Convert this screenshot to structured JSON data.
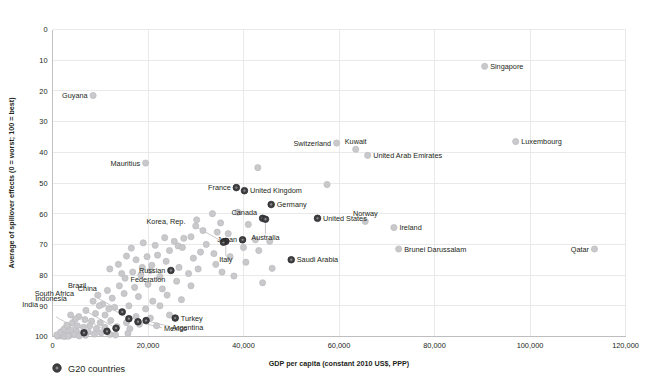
{
  "chart_data": {
    "type": "scatter",
    "title": "",
    "xlabel": "GDP per capita (constant 2010 US$, PPP)",
    "ylabel": "Average of spillover effects (0 = worst; 100 = best)",
    "xlim": [
      0,
      120000
    ],
    "ylim": [
      0,
      100
    ],
    "y_inverted": true,
    "xticks": [
      0,
      20000,
      40000,
      60000,
      80000,
      100000,
      120000
    ],
    "xticklabels": [
      "0",
      "20,000",
      "40,000",
      "60,000",
      "80,000",
      "100,000",
      "120,000"
    ],
    "yticks": [
      0,
      10,
      20,
      30,
      40,
      50,
      60,
      70,
      80,
      90,
      100
    ],
    "yticklabels": [
      "0",
      "10",
      "20",
      "30",
      "40",
      "50",
      "60",
      "70",
      "80",
      "90",
      "100"
    ],
    "grid": true,
    "legend_position": "bottom-left",
    "series": [
      {
        "name": "G20 countries",
        "color": "#3f3f42",
        "marker": "circle",
        "points": [
          {
            "label": "France",
            "x": 38500,
            "y": 51.5,
            "label_side": "left"
          },
          {
            "label": "United Kingdom",
            "x": 40200,
            "y": 52.5,
            "label_side": "right"
          },
          {
            "label": "Germany",
            "x": 45800,
            "y": 57.0,
            "label_side": "right"
          },
          {
            "label": "Canada",
            "x": 44000,
            "y": 61.5,
            "label_side": "left-above"
          },
          {
            "label": "United States",
            "x": 55500,
            "y": 61.5,
            "label_side": "right"
          },
          {
            "label": "Japan",
            "x": 39800,
            "y": 68.5,
            "label_side": "left"
          },
          {
            "label": "Australia",
            "x": 44600,
            "y": 61.8,
            "label_side": "below-leader"
          },
          {
            "label": "Italy",
            "x": 36300,
            "y": 69.0,
            "label_side": "below-leader"
          },
          {
            "label": "Korea, Rep.",
            "x": 35800,
            "y": 69.3,
            "label_side": "left-leader"
          },
          {
            "label": "Saudi Arabia",
            "x": 50000,
            "y": 75.0,
            "label_side": "right"
          },
          {
            "label": "Russian Federation",
            "x": 24800,
            "y": 78.5,
            "label_side": "left"
          },
          {
            "label": "Turkey",
            "x": 25700,
            "y": 94.0,
            "label_side": "right"
          },
          {
            "label": "Brazil",
            "x": 14600,
            "y": 92.0,
            "label_side": "left-leader"
          },
          {
            "label": "China",
            "x": 16000,
            "y": 94.2,
            "label_side": "left-leader"
          },
          {
            "label": "Argentina",
            "x": 19600,
            "y": 94.8,
            "label_side": "right-leader"
          },
          {
            "label": "Mexico",
            "x": 17900,
            "y": 95.2,
            "label_side": "right-leader"
          },
          {
            "label": "South Africa",
            "x": 13300,
            "y": 97.3,
            "label_side": "left-leader"
          },
          {
            "label": "Indonesia",
            "x": 11400,
            "y": 98.3,
            "label_side": "left-leader"
          },
          {
            "label": "India",
            "x": 6600,
            "y": 98.8,
            "label_side": "left-leader"
          }
        ]
      },
      {
        "name": "Other countries",
        "color": "#c9c9cc",
        "marker": "circle",
        "points": [
          {
            "label": "Singapore",
            "x": 90500,
            "y": 12.0,
            "label_side": "right"
          },
          {
            "label": "Guyana",
            "x": 8500,
            "y": 21.5,
            "label_side": "left"
          },
          {
            "label": "Luxembourg",
            "x": 97000,
            "y": 36.5,
            "label_side": "right"
          },
          {
            "label": "Switzerland",
            "x": 59500,
            "y": 37.0,
            "label_side": "left"
          },
          {
            "label": "Kuwait",
            "x": 63500,
            "y": 39.0,
            "label_side": "above"
          },
          {
            "label": "United Arab Emirates",
            "x": 66000,
            "y": 41.0,
            "label_side": "right"
          },
          {
            "label": "Mauritius",
            "x": 19500,
            "y": 43.5,
            "label_side": "left"
          },
          {
            "label": "Norway",
            "x": 65500,
            "y": 62.5,
            "label_side": "above"
          },
          {
            "label": "Ireland",
            "x": 71500,
            "y": 64.5,
            "label_side": "right"
          },
          {
            "label": "Brunei Darussalam",
            "x": 72500,
            "y": 71.5,
            "label_side": "right"
          },
          {
            "label": "Qatar",
            "x": 113500,
            "y": 71.5,
            "label_side": "left"
          },
          {
            "label": "",
            "x": 43000,
            "y": 45.0
          },
          {
            "label": "",
            "x": 57500,
            "y": 50.5
          },
          {
            "label": "",
            "x": 38800,
            "y": 59.5
          },
          {
            "label": "",
            "x": 33500,
            "y": 60.0
          },
          {
            "label": "",
            "x": 30000,
            "y": 64.0
          },
          {
            "label": "",
            "x": 31500,
            "y": 65.5
          },
          {
            "label": "",
            "x": 34500,
            "y": 66.0
          },
          {
            "label": "",
            "x": 36800,
            "y": 66.5
          },
          {
            "label": "",
            "x": 29000,
            "y": 67.5
          },
          {
            "label": "",
            "x": 27500,
            "y": 68.0
          },
          {
            "label": "",
            "x": 25500,
            "y": 69.0
          },
          {
            "label": "",
            "x": 23500,
            "y": 67.8
          },
          {
            "label": "",
            "x": 26300,
            "y": 70.5
          },
          {
            "label": "",
            "x": 27200,
            "y": 71.0
          },
          {
            "label": "",
            "x": 32200,
            "y": 70.0
          },
          {
            "label": "",
            "x": 42500,
            "y": 68.5
          },
          {
            "label": "",
            "x": 45500,
            "y": 69.0
          },
          {
            "label": "",
            "x": 21500,
            "y": 70.3
          },
          {
            "label": "",
            "x": 19000,
            "y": 69.5
          },
          {
            "label": "",
            "x": 16500,
            "y": 71.2
          },
          {
            "label": "",
            "x": 31000,
            "y": 72.5
          },
          {
            "label": "",
            "x": 33800,
            "y": 73.0
          },
          {
            "label": "",
            "x": 29500,
            "y": 74.5
          },
          {
            "label": "",
            "x": 24500,
            "y": 72.0
          },
          {
            "label": "",
            "x": 22000,
            "y": 73.5
          },
          {
            "label": "",
            "x": 19800,
            "y": 74.0
          },
          {
            "label": "",
            "x": 17500,
            "y": 75.0
          },
          {
            "label": "",
            "x": 15500,
            "y": 73.8
          },
          {
            "label": "",
            "x": 13800,
            "y": 76.5
          },
          {
            "label": "",
            "x": 12000,
            "y": 78.0
          },
          {
            "label": "",
            "x": 14500,
            "y": 79.5
          },
          {
            "label": "",
            "x": 16800,
            "y": 79.0
          },
          {
            "label": "",
            "x": 15200,
            "y": 81.0
          },
          {
            "label": "",
            "x": 18500,
            "y": 80.0
          },
          {
            "label": "",
            "x": 20500,
            "y": 78.5
          },
          {
            "label": "",
            "x": 22500,
            "y": 80.5
          },
          {
            "label": "",
            "x": 26500,
            "y": 77.5
          },
          {
            "label": "",
            "x": 28500,
            "y": 79.5
          },
          {
            "label": "",
            "x": 30500,
            "y": 78.0
          },
          {
            "label": "",
            "x": 35500,
            "y": 79.0
          },
          {
            "label": "",
            "x": 38000,
            "y": 80.3
          },
          {
            "label": "",
            "x": 44000,
            "y": 82.5
          },
          {
            "label": "",
            "x": 29000,
            "y": 83.5
          },
          {
            "label": "",
            "x": 26000,
            "y": 82.0
          },
          {
            "label": "",
            "x": 23000,
            "y": 84.5
          },
          {
            "label": "",
            "x": 20000,
            "y": 83.0
          },
          {
            "label": "",
            "x": 17200,
            "y": 84.0
          },
          {
            "label": "",
            "x": 14000,
            "y": 83.5
          },
          {
            "label": "",
            "x": 11500,
            "y": 85.0
          },
          {
            "label": "",
            "x": 9500,
            "y": 86.5
          },
          {
            "label": "",
            "x": 12500,
            "y": 87.5
          },
          {
            "label": "",
            "x": 15000,
            "y": 86.0
          },
          {
            "label": "",
            "x": 18000,
            "y": 87.0
          },
          {
            "label": "",
            "x": 21000,
            "y": 88.5
          },
          {
            "label": "",
            "x": 24000,
            "y": 86.5
          },
          {
            "label": "",
            "x": 27000,
            "y": 88.0
          },
          {
            "label": "",
            "x": 8500,
            "y": 88.5
          },
          {
            "label": "",
            "x": 10500,
            "y": 89.5
          },
          {
            "label": "",
            "x": 13000,
            "y": 90.5
          },
          {
            "label": "",
            "x": 16000,
            "y": 90.0
          },
          {
            "label": "",
            "x": 19500,
            "y": 91.0
          },
          {
            "label": "",
            "x": 22500,
            "y": 90.0
          },
          {
            "label": "",
            "x": 7000,
            "y": 91.5
          },
          {
            "label": "",
            "x": 9000,
            "y": 92.5
          },
          {
            "label": "",
            "x": 11000,
            "y": 93.0
          },
          {
            "label": "",
            "x": 14500,
            "y": 92.0
          },
          {
            "label": "",
            "x": 17500,
            "y": 93.5
          },
          {
            "label": "",
            "x": 20500,
            "y": 94.0
          },
          {
            "label": "",
            "x": 5500,
            "y": 93.5
          },
          {
            "label": "",
            "x": 6800,
            "y": 94.5
          },
          {
            "label": "",
            "x": 8200,
            "y": 95.0
          },
          {
            "label": "",
            "x": 10000,
            "y": 95.5
          },
          {
            "label": "",
            "x": 12200,
            "y": 94.8
          },
          {
            "label": "",
            "x": 15500,
            "y": 95.5
          },
          {
            "label": "",
            "x": 18200,
            "y": 96.0
          },
          {
            "label": "",
            "x": 4200,
            "y": 95.5
          },
          {
            "label": "",
            "x": 5200,
            "y": 96.5
          },
          {
            "label": "",
            "x": 6500,
            "y": 97.0
          },
          {
            "label": "",
            "x": 7800,
            "y": 96.5
          },
          {
            "label": "",
            "x": 9200,
            "y": 97.5
          },
          {
            "label": "",
            "x": 11000,
            "y": 97.0
          },
          {
            "label": "",
            "x": 13500,
            "y": 96.8
          },
          {
            "label": "",
            "x": 16200,
            "y": 97.5
          },
          {
            "label": "",
            "x": 3200,
            "y": 97.0
          },
          {
            "label": "",
            "x": 4000,
            "y": 98.0
          },
          {
            "label": "",
            "x": 5000,
            "y": 98.5
          },
          {
            "label": "",
            "x": 6200,
            "y": 99.0
          },
          {
            "label": "",
            "x": 7500,
            "y": 98.5
          },
          {
            "label": "",
            "x": 8800,
            "y": 99.2
          },
          {
            "label": "",
            "x": 10200,
            "y": 98.8
          },
          {
            "label": "",
            "x": 12000,
            "y": 99.3
          },
          {
            "label": "",
            "x": 2200,
            "y": 98.2
          },
          {
            "label": "",
            "x": 2800,
            "y": 99.2
          },
          {
            "label": "",
            "x": 3600,
            "y": 99.6
          },
          {
            "label": "",
            "x": 4600,
            "y": 99.4
          },
          {
            "label": "",
            "x": 5600,
            "y": 99.8
          },
          {
            "label": "",
            "x": 6900,
            "y": 99.6
          },
          {
            "label": "",
            "x": 1500,
            "y": 99.4
          },
          {
            "label": "",
            "x": 1900,
            "y": 99.8
          },
          {
            "label": "",
            "x": 2500,
            "y": 100.0
          },
          {
            "label": "",
            "x": 3300,
            "y": 99.9
          },
          {
            "label": "",
            "x": 1100,
            "y": 99.9
          },
          {
            "label": "",
            "x": 900,
            "y": 99.5
          },
          {
            "label": "",
            "x": 1700,
            "y": 98.6
          },
          {
            "label": "",
            "x": 2400,
            "y": 97.6
          },
          {
            "label": "",
            "x": 3000,
            "y": 96.3
          },
          {
            "label": "",
            "x": 4800,
            "y": 94.3
          },
          {
            "label": "",
            "x": 3800,
            "y": 93.0
          },
          {
            "label": "",
            "x": 24500,
            "y": 93.0
          },
          {
            "label": "",
            "x": 21800,
            "y": 96.5
          },
          {
            "label": "",
            "x": 13200,
            "y": 99.5
          },
          {
            "label": "",
            "x": 15800,
            "y": 99.0
          },
          {
            "label": "",
            "x": 11800,
            "y": 91.0
          },
          {
            "label": "",
            "x": 9800,
            "y": 90.0
          },
          {
            "label": "",
            "x": 23800,
            "y": 75.5
          },
          {
            "label": "",
            "x": 20800,
            "y": 76.8
          },
          {
            "label": "",
            "x": 18800,
            "y": 77.5
          },
          {
            "label": "",
            "x": 34200,
            "y": 76.5
          },
          {
            "label": "",
            "x": 40500,
            "y": 75.8
          },
          {
            "label": "",
            "x": 46000,
            "y": 77.8
          },
          {
            "label": "",
            "x": 43200,
            "y": 72.0
          },
          {
            "label": "",
            "x": 40000,
            "y": 71.0
          },
          {
            "label": "",
            "x": 37200,
            "y": 74.0
          },
          {
            "label": "",
            "x": 30200,
            "y": 62.0
          },
          {
            "label": "",
            "x": 35200,
            "y": 63.0
          },
          {
            "label": "",
            "x": 41000,
            "y": 63.5
          }
        ]
      }
    ]
  },
  "legend": {
    "entries": [
      {
        "label": "G20 countries",
        "color": "#3f3f42"
      }
    ]
  },
  "axes": {
    "x_title": "GDP per capita (constant 2010 US$, PPP)",
    "y_title": "Average of spillover effects (0 = worst; 100 = best)"
  }
}
